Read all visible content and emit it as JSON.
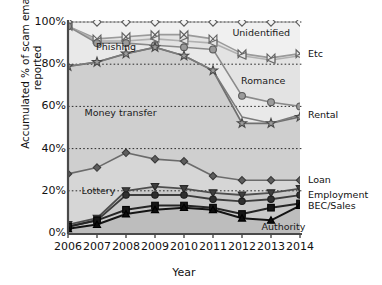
{
  "chart_data": {
    "type": "line",
    "title": "",
    "subtitle": "",
    "xlabel": "Year",
    "ylabel": "Accumulated % of scam emails reported",
    "x": [
      2006,
      2007,
      2008,
      2009,
      2010,
      2011,
      2012,
      2013,
      2014
    ],
    "xtick_labels": [
      "2006",
      "2007",
      "2008",
      "2009",
      "2010",
      "2011",
      "2012",
      "2013",
      "2014"
    ],
    "ytick_labels": [
      "0%",
      "20%",
      "40%",
      "60%",
      "80%",
      "100%"
    ],
    "ytick_values": [
      0,
      20,
      40,
      60,
      80,
      100
    ],
    "ylim": [
      0,
      104
    ],
    "xlim": [
      2006,
      2014
    ],
    "grid": "horizontal-dotted",
    "legend": "inline-labels",
    "note": "cumulative stacked percentage; each series is a cumulative boundary",
    "series": [
      {
        "name": "Unidentified",
        "marker": "diamond",
        "label_position": "inline",
        "values": [
          100,
          100,
          100,
          100,
          100,
          100,
          100,
          100,
          100
        ]
      },
      {
        "name": "Etc",
        "marker": "bowtie",
        "label_position": "right-edge",
        "values": [
          98,
          92,
          93,
          94,
          94,
          92,
          85,
          83,
          85
        ]
      },
      {
        "name": "Phishing",
        "marker": "left-triangle",
        "label_position": "inline",
        "values": [
          98,
          91,
          91,
          92,
          91,
          90,
          84,
          82,
          84
        ]
      },
      {
        "name": "Romance",
        "marker": "circle",
        "label_position": "inline",
        "values": [
          98,
          90,
          90,
          89,
          88,
          87,
          65,
          62,
          60
        ]
      },
      {
        "name": "Rental",
        "marker": "star",
        "label_position": "right-edge",
        "values": [
          79,
          81,
          85,
          88,
          84,
          77,
          52,
          52,
          55
        ]
      },
      {
        "name": "Money transfer",
        "marker": "none",
        "label_position": "inline",
        "values": [
          79,
          81,
          85,
          88,
          84,
          77,
          55,
          52,
          56
        ]
      },
      {
        "name": "Loan",
        "marker": "diamond-small",
        "label_position": "right-edge",
        "values": [
          28,
          31,
          38,
          35,
          34,
          27,
          25,
          25,
          25
        ]
      },
      {
        "name": "Lottery",
        "marker": "down-triangle",
        "label_position": "inline",
        "values": [
          4,
          7,
          20,
          22,
          21,
          19,
          18,
          19,
          21
        ]
      },
      {
        "name": "Employment",
        "marker": "circle-small",
        "label_position": "right-edge",
        "values": [
          3,
          6,
          18,
          18,
          18,
          16,
          15,
          16,
          18
        ]
      },
      {
        "name": "BEC/Sales",
        "marker": "square",
        "label_position": "right-edge",
        "values": [
          3,
          6,
          11,
          13,
          13,
          12,
          9,
          12,
          14
        ]
      },
      {
        "name": "Authority",
        "marker": "up-triangle",
        "label_position": "inline",
        "values": [
          2,
          4,
          9,
          11,
          12,
          11,
          7,
          6,
          13
        ]
      }
    ],
    "band_labels": [
      {
        "text": "Phishing",
        "x": 2006.9,
        "y": 88
      },
      {
        "text": "Money transfer",
        "x": 2006.5,
        "y": 57
      },
      {
        "text": "Lottery",
        "x": 2006.4,
        "y": 20
      },
      {
        "text": "Unidentified",
        "x": 2011.6,
        "y": 95
      },
      {
        "text": "Romance",
        "x": 2011.9,
        "y": 72
      },
      {
        "text": "Authority",
        "x": 2012.6,
        "y": 3
      }
    ],
    "edge_labels": [
      {
        "text": "Etc",
        "y": 85
      },
      {
        "text": "Rental",
        "y": 56
      },
      {
        "text": "Loan",
        "y": 25
      },
      {
        "text": "Employment",
        "y": 18
      },
      {
        "text": "BEC/Sales",
        "y": 13
      }
    ]
  },
  "ghost_text": {
    "top": "",
    "mid1": "",
    "mid2": ""
  }
}
